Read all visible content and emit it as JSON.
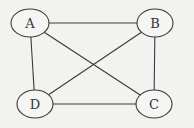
{
  "diagram": {
    "type": "undirected-graph",
    "background": "#f2f2f0",
    "stroke_color": "#3a3a3a",
    "nodes": [
      {
        "id": "A",
        "label": "A",
        "cx": 30,
        "cy": 23,
        "rx": 19,
        "ry": 14
      },
      {
        "id": "B",
        "label": "B",
        "cx": 155,
        "cy": 23,
        "rx": 18,
        "ry": 14
      },
      {
        "id": "C",
        "label": "C",
        "cx": 154,
        "cy": 104,
        "rx": 18,
        "ry": 14
      },
      {
        "id": "D",
        "label": "D",
        "cx": 35,
        "cy": 104,
        "rx": 18,
        "ry": 14
      }
    ],
    "edges": [
      {
        "from": "A",
        "to": "B"
      },
      {
        "from": "A",
        "to": "D"
      },
      {
        "from": "A",
        "to": "C"
      },
      {
        "from": "B",
        "to": "D"
      },
      {
        "from": "B",
        "to": "C"
      },
      {
        "from": "D",
        "to": "C"
      }
    ]
  }
}
